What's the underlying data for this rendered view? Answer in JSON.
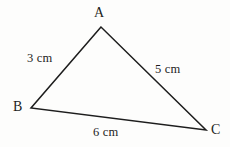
{
  "figure": {
    "type": "triangle-diagram",
    "background_color": "#fdfdfc",
    "stroke_color": "#1d1d1d",
    "text_color": "#1d1d1d",
    "vertices": [
      {
        "name": "A",
        "label": "A",
        "x": 101,
        "y": 27
      },
      {
        "name": "B",
        "label": "B",
        "x": 31,
        "y": 108
      },
      {
        "name": "C",
        "label": "C",
        "x": 206,
        "y": 130
      }
    ],
    "sides": [
      {
        "name": "AB",
        "label": "3 cm",
        "length": 3,
        "unit": "cm",
        "from": "A",
        "to": "B"
      },
      {
        "name": "AC",
        "label": "5 cm",
        "length": 5,
        "unit": "cm",
        "from": "A",
        "to": "C"
      },
      {
        "name": "BC",
        "label": "6 cm",
        "length": 6,
        "unit": "cm",
        "from": "B",
        "to": "C"
      }
    ],
    "labels": {
      "vertex_a": "A",
      "vertex_b": "B",
      "vertex_c": "C",
      "side_ab": "3 cm",
      "side_ac": "5 cm",
      "side_bc": "6 cm"
    },
    "path": "M 101 27 L 31 108 L 206 130 Z"
  }
}
